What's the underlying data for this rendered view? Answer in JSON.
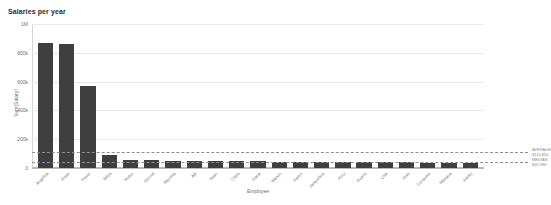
{
  "chart_data": {
    "type": "bar",
    "title": "Salaries per year",
    "xlabel": "Employee",
    "ylabel": "Sum(Salary)",
    "ylim": [
      0,
      1000000
    ],
    "grid": true,
    "legend_position": "none",
    "ytick_labels": [
      "1M",
      "800k",
      "600k",
      "400k",
      "200k",
      "0"
    ],
    "ytick_values": [
      1000000,
      800000,
      600000,
      400000,
      200000,
      0
    ],
    "categories": [
      "Angelica",
      "Jesse",
      "Trevor",
      "Miles",
      "Robin",
      "Dennis",
      "Marcela",
      "Ajit",
      "Sean",
      "Clara",
      "Dana",
      "Marvin",
      "Karen",
      "Jacqueline",
      "Rory",
      "Duane",
      "Lola",
      "Jose",
      "Consuelo",
      "Mariana",
      "Jimmy"
    ],
    "values": [
      870000,
      862000,
      570000,
      92000,
      56000,
      54000,
      52000,
      50000,
      49000,
      48000,
      46000,
      45000,
      44000,
      43000,
      42000,
      41000,
      40000,
      39000,
      38000,
      37000,
      36000
    ],
    "reference_lines": [
      {
        "name": "average",
        "label": "AVERAGE",
        "value_label": "$110,850",
        "value": 110850,
        "style": "dashed"
      },
      {
        "name": "median",
        "label": "MEDIAN",
        "value_label": "$39,386",
        "value": 39386,
        "style": "dashed"
      }
    ],
    "bar_color": "#3f3f3f",
    "gridline_color": "#e9e9e9",
    "refline_color": "#8e8e8e"
  }
}
